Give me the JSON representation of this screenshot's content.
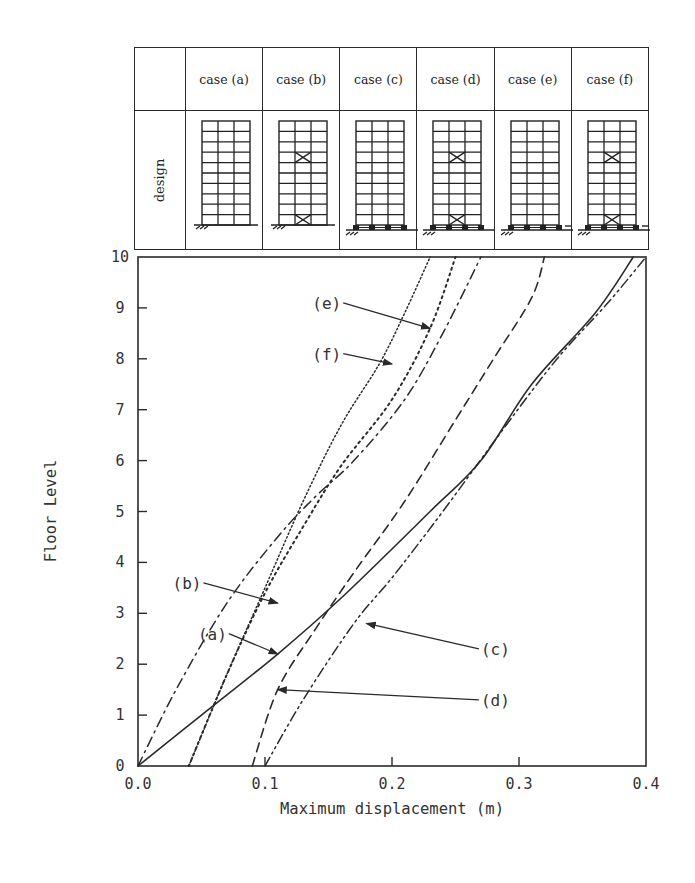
{
  "table": {
    "row_label": "design",
    "cases": [
      {
        "label": "case (a)",
        "base": "fixed",
        "braced": false
      },
      {
        "label": "case (b)",
        "base": "fixed",
        "braced": true
      },
      {
        "label": "case (c)",
        "base": "isolated",
        "braced": false
      },
      {
        "label": "case (d)",
        "base": "isolated",
        "braced": true
      },
      {
        "label": "case (e)",
        "base": "isolated-ext",
        "braced": false
      },
      {
        "label": "case (f)",
        "base": "isolated-ext",
        "braced": true
      }
    ]
  },
  "chart_data": {
    "type": "line",
    "title": "",
    "xlabel": "Maximum displacement (m)",
    "ylabel": "Floor Level",
    "xlim": [
      0.0,
      0.4
    ],
    "ylim": [
      0,
      10
    ],
    "xticks": [
      "0.0",
      "0.1",
      "0.2",
      "0.3",
      "0.4"
    ],
    "yticks": [
      "0",
      "1",
      "2",
      "3",
      "4",
      "5",
      "6",
      "7",
      "8",
      "9",
      "10"
    ],
    "grid": false,
    "legend": "inline annotations",
    "series": [
      {
        "name": "(a)",
        "style": "solid",
        "x": [
          0.0,
          0.05,
          0.11,
          0.16,
          0.23,
          0.27,
          0.31,
          0.36,
          0.39
        ],
        "y": [
          0,
          1,
          2.2,
          3.3,
          5,
          6,
          7.5,
          8.9,
          10
        ]
      },
      {
        "name": "(b)",
        "style": "dash-dot",
        "x": [
          0.0,
          0.03,
          0.07,
          0.11,
          0.14,
          0.17,
          0.21,
          0.24,
          0.27
        ],
        "y": [
          0,
          1.5,
          3.2,
          4.5,
          5.3,
          6,
          7.2,
          8.5,
          10
        ]
      },
      {
        "name": "(c)",
        "style": "dash-dot-dot",
        "x": [
          0.1,
          0.13,
          0.17,
          0.2,
          0.24,
          0.29,
          0.33,
          0.37,
          0.4
        ],
        "y": [
          0,
          1.3,
          2.8,
          3.7,
          5,
          6.7,
          8,
          9.1,
          10
        ]
      },
      {
        "name": "(d)",
        "style": "dashed",
        "x": [
          0.09,
          0.11,
          0.14,
          0.17,
          0.21,
          0.25,
          0.28,
          0.31,
          0.32
        ],
        "y": [
          0,
          1.5,
          2.7,
          3.8,
          5.2,
          6.8,
          8,
          9.2,
          10
        ]
      },
      {
        "name": "(e)",
        "style": "dense-dot",
        "x": [
          0.04,
          0.07,
          0.1,
          0.13,
          0.16,
          0.2,
          0.23,
          0.25
        ],
        "y": [
          0,
          1.8,
          3.4,
          4.7,
          5.9,
          7.2,
          8.6,
          10
        ]
      },
      {
        "name": "(f)",
        "style": "fine-dot",
        "x": [
          0.04,
          0.07,
          0.1,
          0.13,
          0.16,
          0.19,
          0.21,
          0.23
        ],
        "y": [
          0,
          1.8,
          3.5,
          5.2,
          6.7,
          7.9,
          8.9,
          10
        ]
      }
    ],
    "annotations": [
      {
        "label": "(a)",
        "text_at": [
          0.07,
          2.6
        ],
        "arrow_to": [
          0.11,
          2.2
        ]
      },
      {
        "label": "(b)",
        "text_at": [
          0.05,
          3.6
        ],
        "arrow_to": [
          0.11,
          3.2
        ]
      },
      {
        "label": "(c)",
        "text_at": [
          0.27,
          2.3
        ],
        "arrow_to": [
          0.18,
          2.8
        ]
      },
      {
        "label": "(d)",
        "text_at": [
          0.27,
          1.3
        ],
        "arrow_to": [
          0.11,
          1.5
        ]
      },
      {
        "label": "(e)",
        "text_at": [
          0.16,
          9.1
        ],
        "arrow_to": [
          0.23,
          8.6
        ]
      },
      {
        "label": "(f)",
        "text_at": [
          0.16,
          8.1
        ],
        "arrow_to": [
          0.2,
          7.9
        ]
      }
    ]
  }
}
